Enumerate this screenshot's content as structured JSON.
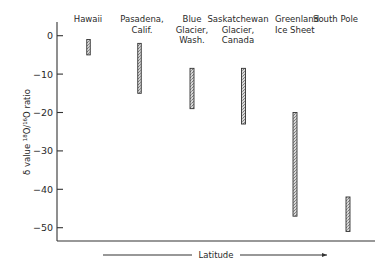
{
  "chart_data": {
    "type": "range-bar",
    "title": "",
    "xlabel": "Latitude",
    "ylabel": "δ value ¹⁸O/¹⁶O ratio",
    "ylim": [
      -54,
      4
    ],
    "yticks": [
      0,
      -10,
      -20,
      -30,
      -40,
      -50
    ],
    "ytick_labels": [
      "0",
      "-10",
      "-20",
      "-30",
      "-40",
      "-50"
    ],
    "grid": false,
    "categories": [
      {
        "name": "Hawaii",
        "label_lines": [
          "Hawaii"
        ]
      },
      {
        "name": "Pasadena, Calif.",
        "label_lines": [
          "Pasadena,",
          "Calif."
        ]
      },
      {
        "name": "Blue Glacier, Wash.",
        "label_lines": [
          "Blue",
          "Glacier,",
          "Wash."
        ]
      },
      {
        "name": "Saskatchewan Glacier, Canada",
        "label_lines": [
          "Saskatchewan",
          "Glacier,",
          "Canada"
        ]
      },
      {
        "name": "Greenland Ice Sheet",
        "label_lines": [
          "Greenland",
          "Ice Sheet"
        ]
      },
      {
        "name": "South Pole",
        "label_lines": [
          "South Pole"
        ]
      }
    ],
    "series": [
      {
        "name": "δ18O range",
        "ranges": [
          {
            "high": -1,
            "low": -5
          },
          {
            "high": -2,
            "low": -15
          },
          {
            "high": -8.5,
            "low": -19
          },
          {
            "high": -8.5,
            "low": -23
          },
          {
            "high": -20,
            "low": -47
          },
          {
            "high": -42,
            "low": -51
          }
        ]
      }
    ],
    "x_axis_arrow": "left-to-right (increasing latitude)"
  }
}
